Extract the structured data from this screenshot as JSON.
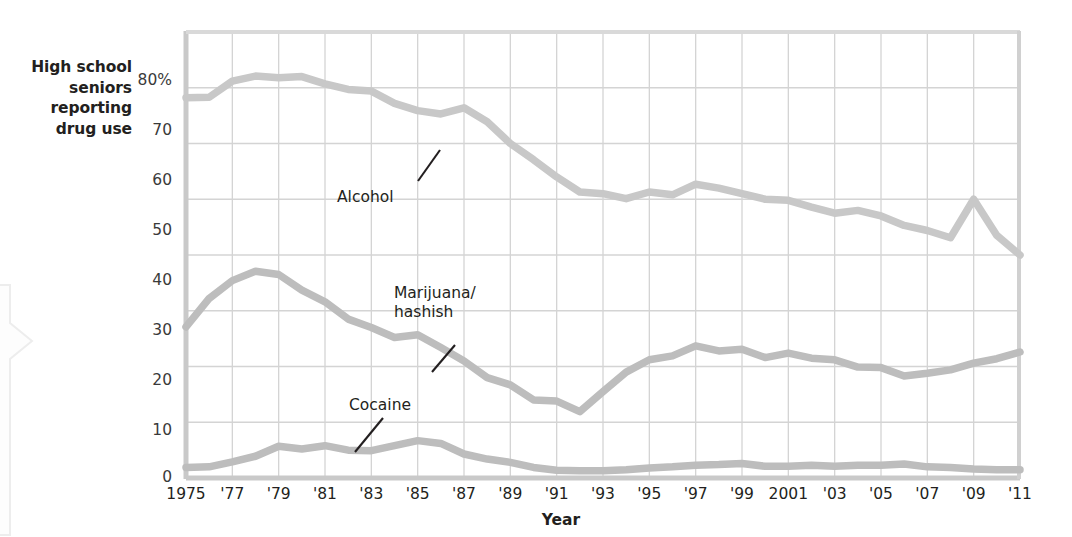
{
  "figure": {
    "y_caption": "High school\nseniors\nreporting\ndrug use",
    "y_caption_lines": [
      "High school",
      "seniors",
      "reporting",
      "drug use"
    ],
    "x_axis_title": "Year",
    "callout_name": "left-page-callout-shape"
  },
  "colors": {
    "alcohol_line": "#c8c8c8",
    "marijuana_line": "#bdbdbd",
    "cocaine_line": "#bdbdbd",
    "grid": "#d4d4d4",
    "axis": "#c9c9c9",
    "text": "#231f20",
    "tick_text": "#3a3a3a"
  },
  "chart_data": {
    "type": "line",
    "title": "",
    "subtitle": "",
    "xlabel": "Year",
    "ylabel": "High school seniors reporting drug use",
    "xlim": [
      1975,
      2011
    ],
    "ylim": [
      0,
      80
    ],
    "grid": true,
    "legend": "inline-annotations",
    "ytick_labels": [
      "80%",
      "70",
      "60",
      "50",
      "40",
      "30",
      "20",
      "10",
      "0"
    ],
    "ytick_values": [
      80,
      70,
      60,
      50,
      40,
      30,
      20,
      10,
      0
    ],
    "xtick_labels": [
      "1975",
      "'77",
      "'79",
      "'81",
      "'83",
      "'85",
      "'87",
      "'89",
      "'91",
      "'93",
      "'95",
      "'97",
      "'99",
      "2001",
      "'03",
      "'05",
      "'07",
      "'09",
      "'11"
    ],
    "xtick_values": [
      1975,
      1977,
      1979,
      1981,
      1983,
      1985,
      1987,
      1989,
      1991,
      1993,
      1995,
      1997,
      1999,
      2001,
      2003,
      2005,
      2007,
      2009,
      2011
    ],
    "x": [
      1975,
      1976,
      1977,
      1978,
      1979,
      1980,
      1981,
      1982,
      1983,
      1984,
      1985,
      1986,
      1987,
      1988,
      1989,
      1990,
      1991,
      1992,
      1993,
      1994,
      1995,
      1996,
      1997,
      1998,
      1999,
      2000,
      2001,
      2002,
      2003,
      2004,
      2005,
      2006,
      2007,
      2008,
      2009,
      2010,
      2011
    ],
    "series": [
      {
        "name": "Alcohol",
        "label": "Alcohol",
        "values": [
          68.2,
          68.3,
          71.2,
          72.1,
          71.8,
          72.0,
          70.7,
          69.7,
          69.4,
          67.2,
          65.9,
          65.3,
          66.4,
          63.9,
          60.0,
          57.1,
          54.0,
          51.3,
          51.0,
          50.1,
          51.3,
          50.8,
          52.7,
          52.0,
          51.0,
          50.0,
          49.8,
          48.6,
          47.5,
          48.0,
          47.0,
          45.3,
          44.4,
          43.1,
          50.0,
          43.5,
          40.0
        ]
      },
      {
        "name": "Marijuana/hashish",
        "label": "Marijuana/\nhashish",
        "label_lines": [
          "Marijuana/",
          "hashish"
        ],
        "values": [
          27.1,
          32.2,
          35.4,
          37.1,
          36.5,
          33.7,
          31.6,
          28.5,
          27.0,
          25.2,
          25.7,
          23.4,
          21.0,
          18.0,
          16.7,
          14.0,
          13.8,
          11.9,
          15.5,
          19.0,
          21.2,
          21.9,
          23.7,
          22.8,
          23.1,
          21.6,
          22.4,
          21.5,
          21.2,
          19.9,
          19.8,
          18.3,
          18.8,
          19.4,
          20.6,
          21.4,
          22.6
        ]
      },
      {
        "name": "Cocaine",
        "label": "Cocaine",
        "values": [
          1.9,
          2.0,
          2.9,
          3.9,
          5.7,
          5.2,
          5.8,
          5.0,
          4.9,
          5.8,
          6.7,
          6.2,
          4.3,
          3.4,
          2.8,
          1.9,
          1.4,
          1.3,
          1.3,
          1.5,
          1.8,
          2.0,
          2.3,
          2.4,
          2.6,
          2.1,
          2.1,
          2.3,
          2.1,
          2.3,
          2.3,
          2.5,
          2.0,
          1.9,
          1.6,
          1.5,
          1.5
        ]
      }
    ],
    "annotations": [
      {
        "text": "Alcohol",
        "points_to_year": 1986,
        "points_to_value": 66
      },
      {
        "text": "Marijuana/hashish",
        "points_to_year": 1985,
        "points_to_value": 26
      },
      {
        "text": "Cocaine",
        "points_to_year": 1981,
        "points_to_value": 5.8
      }
    ]
  }
}
